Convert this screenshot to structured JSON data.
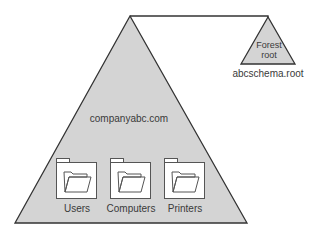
{
  "diagram": {
    "domain_tree": {
      "label": "companyabc.com",
      "fill": "#d4d4d4",
      "stroke": "#333333",
      "containers": [
        {
          "label": "Users",
          "icon": "folder-icon"
        },
        {
          "label": "Computers",
          "icon": "folder-icon"
        },
        {
          "label": "Printers",
          "icon": "folder-icon"
        }
      ]
    },
    "forest_root": {
      "label_line1": "Forest",
      "label_line2": "root",
      "caption": "abcschema.root",
      "fill": "#d4d4d4",
      "stroke": "#333333"
    },
    "connector": {
      "stroke": "#333333"
    }
  }
}
